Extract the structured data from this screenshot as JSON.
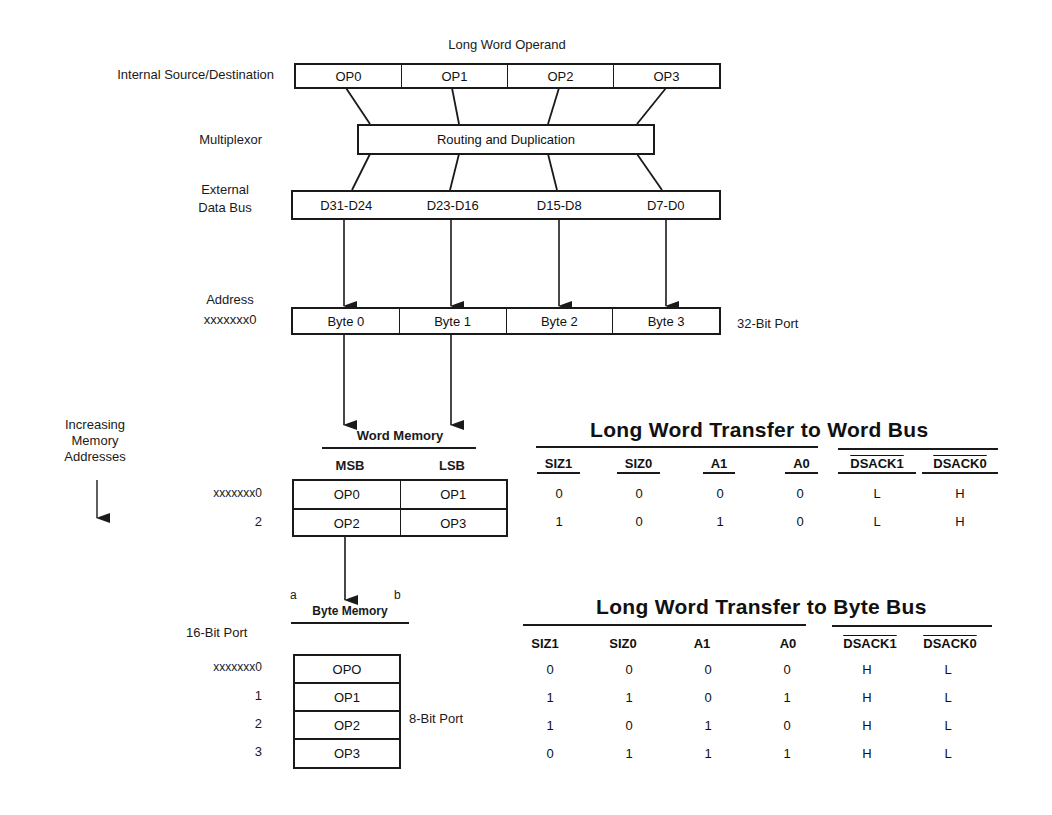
{
  "top": {
    "operand_title": "Long Word Operand",
    "internal_label": "Internal Source/Destination",
    "operand_cells": [
      "OP0",
      "OP1",
      "OP2",
      "OP3"
    ],
    "multiplexor_label": "Multiplexor",
    "routing_label": "Routing and Duplication",
    "data_bus_label_1": "External",
    "data_bus_label_2": "Data Bus",
    "data_bus_cells": [
      "D31-D24",
      "D23-D16",
      "D15-D8",
      "D7-D0"
    ],
    "address_label_1": "Address",
    "address_label_2": "xxxxxxx0",
    "byte_cells": [
      "Byte 0",
      "Byte 1",
      "Byte 2",
      "Byte 3"
    ],
    "port_32_label": "32-Bit Port"
  },
  "side": {
    "increasing_1": "Increasing",
    "increasing_2": "Memory",
    "increasing_3": "Addresses"
  },
  "word_memory": {
    "title": "Word Memory",
    "col_msb": "MSB",
    "col_lsb": "LSB",
    "rows": [
      {
        "addr": "xxxxxxx0",
        "msb": "OP0",
        "lsb": "OP1"
      },
      {
        "addr": "2",
        "msb": "OP2",
        "lsb": "OP3"
      }
    ]
  },
  "byte_memory": {
    "marker_a": "a",
    "marker_b": "b",
    "title": "Byte Memory",
    "port_16_label": "16-Bit Port",
    "port_8_label": "8-Bit Port",
    "rows": [
      {
        "addr": "xxxxxxx0",
        "value": "OPO"
      },
      {
        "addr": "1",
        "value": "OP1"
      },
      {
        "addr": "2",
        "value": "OP2"
      },
      {
        "addr": "3",
        "value": "OP3"
      }
    ]
  },
  "word_bus_table": {
    "title": "Long Word Transfer to Word Bus",
    "headers": [
      "SIZ1",
      "SIZ0",
      "A1",
      "A0",
      "DSACK1",
      "DSACK0"
    ],
    "rows": [
      [
        "0",
        "0",
        "0",
        "0",
        "L",
        "H"
      ],
      [
        "1",
        "0",
        "1",
        "0",
        "L",
        "H"
      ]
    ]
  },
  "byte_bus_table": {
    "title": "Long Word Transfer to Byte Bus",
    "headers": [
      "SIZ1",
      "SIZ0",
      "A1",
      "A0",
      "DSACK1",
      "DSACK0"
    ],
    "rows": [
      [
        "0",
        "0",
        "0",
        "0",
        "H",
        "L"
      ],
      [
        "1",
        "1",
        "0",
        "1",
        "H",
        "L"
      ],
      [
        "1",
        "0",
        "1",
        "0",
        "H",
        "L"
      ],
      [
        "0",
        "1",
        "1",
        "1",
        "H",
        "L"
      ]
    ]
  }
}
